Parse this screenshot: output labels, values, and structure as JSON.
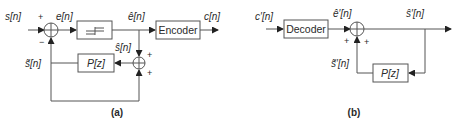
{
  "diagram_a": {
    "caption": "(a)",
    "title": "DPCM encoder",
    "signals": {
      "input": "s[n]",
      "error": "e[n]",
      "quantized_error": "ê[n]",
      "code": "c[n]",
      "reconstructed": "ŝ[n]",
      "predicted": "s̃[n]"
    },
    "blocks": {
      "quantizer": "quantizer",
      "encoder": "Encoder",
      "predictor": "P[z]"
    },
    "signs": {
      "sum1_plus": "+",
      "sum1_minus": "−",
      "sum2_top": "+",
      "sum2_bottom": "+"
    }
  },
  "diagram_b": {
    "caption": "(b)",
    "title": "DPCM decoder",
    "signals": {
      "input": "c′[n]",
      "quantized_error": "ê′[n]",
      "output": "ŝ′[n]",
      "predicted": "s̃′[n]"
    },
    "blocks": {
      "decoder": "Decoder",
      "predictor": "P[z]"
    },
    "signs": {
      "sum_left": "+",
      "sum_right": "+"
    }
  },
  "colors": {
    "line": "#555555",
    "text": "#2a2a2a",
    "background": "#ffffff"
  }
}
